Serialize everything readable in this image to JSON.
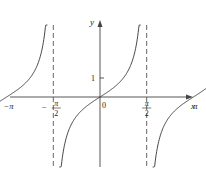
{
  "chart_data": {
    "type": "line",
    "title": "",
    "function": "y = tan(x)",
    "xlabel": "x",
    "ylabel": "y",
    "origin_label": "0",
    "y_tick_labels": [
      "1"
    ],
    "x_tick_labels": [
      {
        "value": -4.712389,
        "label": "-3π/2",
        "kind": "fraction",
        "sign": "−",
        "num": "3π",
        "den": "2"
      },
      {
        "value": -3.141593,
        "label": "-π",
        "kind": "simple",
        "text": "−π"
      },
      {
        "value": -1.570796,
        "label": "-π/2",
        "kind": "fraction",
        "sign": "−",
        "num": "π",
        "den": "2"
      },
      {
        "value": 1.570796,
        "label": "π/2",
        "kind": "fraction",
        "sign": "",
        "num": "π",
        "den": "2"
      },
      {
        "value": 3.141593,
        "label": "π",
        "kind": "simple",
        "text": "π"
      },
      {
        "value": 4.712389,
        "label": "3π/2",
        "kind": "fraction",
        "sign": "",
        "num": "3π",
        "den": "2"
      }
    ],
    "asymptotes_x": [
      -4.712389,
      -1.570796,
      1.570796,
      4.712389
    ],
    "asymptote_style": "dashed",
    "xlim": [
      -5.0,
      5.6
    ],
    "ylim": [
      -3.7,
      3.9
    ],
    "grid": false,
    "legend": null,
    "series": [
      {
        "name": "tan(x) branch 1",
        "x_range": [
          -4.5,
          -1.77
        ]
      },
      {
        "name": "tan(x) branch 2",
        "x_range": [
          -1.37,
          1.37
        ]
      },
      {
        "name": "tan(x) branch 3",
        "x_range": [
          1.77,
          4.5
        ]
      }
    ],
    "colors": {
      "curve": "#333333",
      "axis": "#444444",
      "asymptote": "#555555"
    }
  }
}
